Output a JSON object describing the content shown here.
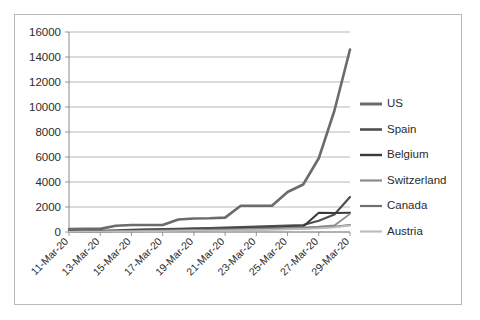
{
  "chart_data": {
    "type": "line",
    "title": "",
    "subtitle": "",
    "xlabel": "",
    "ylabel": "",
    "grid": true,
    "legend_position": "right",
    "ylim": [
      0,
      16000
    ],
    "y_ticks": [
      "0",
      "2000",
      "4000",
      "6000",
      "8000",
      "10000",
      "12000",
      "14000",
      "16000"
    ],
    "y_tick_values": [
      0,
      2000,
      4000,
      6000,
      8000,
      10000,
      12000,
      14000,
      16000
    ],
    "x": [
      "11-Mar-20",
      "12-Mar-20",
      "13-Mar-20",
      "14-Mar-20",
      "15-Mar-20",
      "16-Mar-20",
      "17-Mar-20",
      "18-Mar-20",
      "19-Mar-20",
      "20-Mar-20",
      "21-Mar-20",
      "22-Mar-20",
      "23-Mar-20",
      "24-Mar-20",
      "25-Mar-20",
      "26-Mar-20",
      "27-Mar-20",
      "28-Mar-20",
      "29-Mar-20"
    ],
    "x_tick_labels": [
      "11-Mar-20",
      "13-Mar-20",
      "15-Mar-20",
      "17-Mar-20",
      "19-Mar-20",
      "21-Mar-20",
      "23-Mar-20",
      "25-Mar-20",
      "27-Mar-20",
      "29-Mar-20"
    ],
    "x_tick_indices": [
      0,
      2,
      4,
      6,
      8,
      10,
      12,
      14,
      16,
      18
    ],
    "series": [
      {
        "name": "US",
        "color": "#6b6b6b",
        "width": 2.6,
        "values": [
          240,
          250,
          250,
          500,
          560,
          560,
          560,
          1000,
          1080,
          1100,
          1150,
          2100,
          2100,
          2100,
          3200,
          3800,
          5900,
          9700,
          14600
        ]
      },
      {
        "name": "Spain",
        "color": "#4f4f4f",
        "width": 2.2,
        "values": [
          60,
          80,
          100,
          140,
          180,
          210,
          240,
          260,
          290,
          320,
          360,
          400,
          430,
          480,
          520,
          560,
          900,
          1400,
          2800
        ]
      },
      {
        "name": "Belgium",
        "color": "#3a3a3a",
        "width": 2.0,
        "values": [
          40,
          55,
          70,
          90,
          110,
          130,
          150,
          175,
          200,
          230,
          260,
          290,
          320,
          360,
          400,
          450,
          1550,
          1520,
          1550
        ]
      },
      {
        "name": "Switzerland",
        "color": "#8a8a8a",
        "width": 1.8,
        "values": [
          30,
          40,
          55,
          70,
          85,
          100,
          120,
          140,
          160,
          185,
          210,
          235,
          260,
          290,
          320,
          360,
          420,
          520,
          1450
        ]
      },
      {
        "name": "Canada",
        "color": "#707070",
        "width": 1.8,
        "values": [
          20,
          28,
          36,
          46,
          58,
          70,
          84,
          98,
          115,
          132,
          150,
          170,
          190,
          215,
          240,
          270,
          330,
          420,
          560
        ]
      },
      {
        "name": "Austria",
        "color": "#bdbdbd",
        "width": 1.8,
        "values": [
          15,
          22,
          30,
          40,
          50,
          62,
          75,
          88,
          102,
          118,
          135,
          152,
          170,
          195,
          220,
          250,
          300,
          380,
          520
        ]
      }
    ]
  }
}
